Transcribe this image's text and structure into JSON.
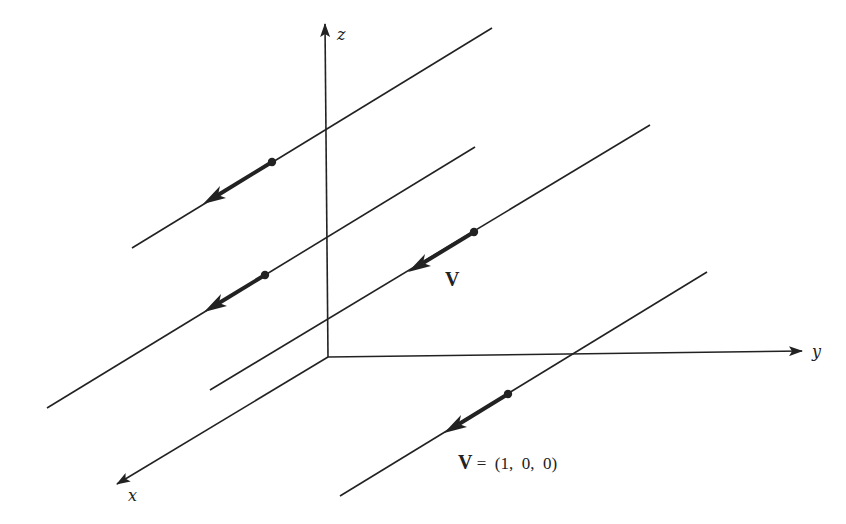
{
  "diagram": {
    "axes": {
      "z": {
        "label": "z"
      },
      "y": {
        "label": "y"
      },
      "x": {
        "label": "x"
      }
    },
    "labels": {
      "vector_label": "V",
      "equation_bold": "V",
      "equation_rest": " =  (1,  0,  0)"
    },
    "colors": {
      "line": "#222222",
      "background": "#ffffff"
    },
    "field_lines": [
      {
        "from": [
          492,
          28
        ],
        "to": [
          132,
          248
        ],
        "point": [
          272,
          162
        ]
      },
      {
        "from": [
          475,
          147
        ],
        "to": [
          47,
          408
        ],
        "point": [
          265,
          275
        ]
      },
      {
        "from": [
          650,
          125
        ],
        "to": [
          210,
          390
        ],
        "point": [
          474,
          232
        ]
      },
      {
        "from": [
          707,
          272
        ],
        "to": [
          340,
          496
        ],
        "point": [
          508,
          394
        ]
      }
    ]
  }
}
